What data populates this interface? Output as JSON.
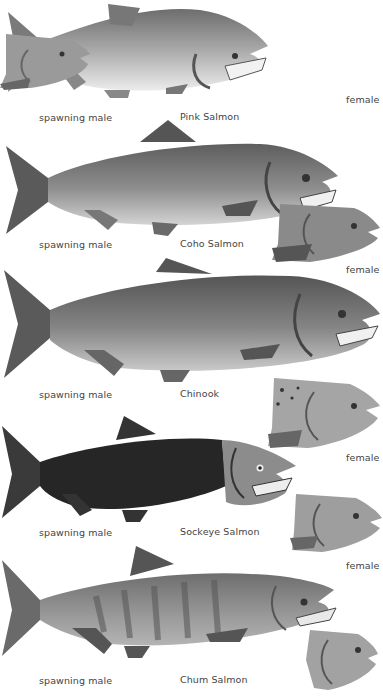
{
  "species": [
    {
      "name": "Pink Salmon",
      "male_label": "spawning male",
      "female_label": "female",
      "body_color": "#8f8f8f",
      "belly_color": "#e4e4e4"
    },
    {
      "name": "Coho Salmon",
      "male_label": "spawning male",
      "female_label": "female",
      "body_color": "#7a7a7a",
      "belly_color": "#cfcfcf"
    },
    {
      "name": "Chinook",
      "male_label": "spawning male",
      "female_label": "female",
      "body_color": "#6e6e6e",
      "belly_color": "#bdbdbd"
    },
    {
      "name": "Sockeye Salmon",
      "male_label": "spawning male",
      "female_label": "female",
      "body_color": "#2a2a2a",
      "belly_color": "#3a3a3a"
    },
    {
      "name": "Chum Salmon",
      "male_label": "spawning male",
      "female_label": "",
      "body_color": "#8a8a8a",
      "belly_color": "#b0b0b0"
    }
  ]
}
